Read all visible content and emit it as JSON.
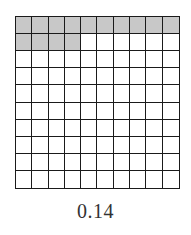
{
  "diagram": {
    "type": "decimal-hundredths-grid",
    "rows": 10,
    "columns": 10,
    "shaded_count": 14,
    "total_cells": 100,
    "label": "0.14",
    "colors": {
      "shaded": "#c8c8c8",
      "unshaded": "#ffffff",
      "grid_lines": "#1a1a1a",
      "label_text": "#333333"
    }
  }
}
